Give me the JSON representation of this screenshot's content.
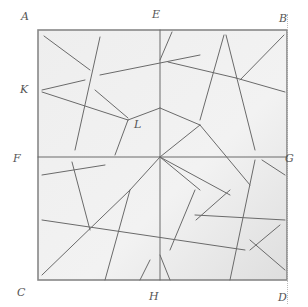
{
  "diagram": {
    "title": "",
    "colors": {
      "paper": "#eeeeee",
      "border": "#888888",
      "line": "#6a6a6a",
      "label": "#555555"
    },
    "labels": [
      {
        "id": "A",
        "text": "A",
        "x": 26,
        "y": 20
      },
      {
        "id": "E",
        "text": "E",
        "x": 157,
        "y": 18
      },
      {
        "id": "B",
        "text": "B",
        "x": 284,
        "y": 22
      },
      {
        "id": "K",
        "text": "K",
        "x": 25,
        "y": 93
      },
      {
        "id": "L",
        "text": "L",
        "x": 139,
        "y": 128
      },
      {
        "id": "F",
        "text": "F",
        "x": 18,
        "y": 162
      },
      {
        "id": "G",
        "text": "G",
        "x": 290,
        "y": 162
      },
      {
        "id": "C",
        "text": "C",
        "x": 22,
        "y": 296
      },
      {
        "id": "H",
        "text": "H",
        "x": 154,
        "y": 300
      },
      {
        "id": "D",
        "text": "D",
        "x": 283,
        "y": 301
      }
    ],
    "square": {
      "x1": 38,
      "y1": 30,
      "x2": 287,
      "y2": 280
    },
    "lines": [
      [
        160,
        30,
        160,
        280
      ],
      [
        38,
        157,
        287,
        157
      ],
      [
        44,
        36,
        90,
        70
      ],
      [
        100,
        37,
        75,
        150
      ],
      [
        42,
        90,
        85,
        80
      ],
      [
        100,
        75,
        200,
        55
      ],
      [
        42,
        92,
        128,
        120
      ],
      [
        95,
        90,
        128,
        118
      ],
      [
        128,
        120,
        160,
        108
      ],
      [
        160,
        108,
        200,
        125
      ],
      [
        172,
        32,
        160,
        60
      ],
      [
        168,
        62,
        236,
        78
      ],
      [
        236,
        78,
        285,
        92
      ],
      [
        224,
        35,
        200,
        120
      ],
      [
        226,
        35,
        255,
        150
      ],
      [
        284,
        35,
        240,
        80
      ],
      [
        128,
        120,
        115,
        155
      ],
      [
        200,
        125,
        250,
        185
      ],
      [
        42,
        175,
        105,
        165
      ],
      [
        72,
        162,
        90,
        230
      ],
      [
        42,
        220,
        245,
        250
      ],
      [
        42,
        275,
        130,
        190
      ],
      [
        130,
        190,
        160,
        157
      ],
      [
        130,
        190,
        105,
        280
      ],
      [
        160,
        157,
        200,
        125
      ],
      [
        160,
        157,
        230,
        195
      ],
      [
        195,
        190,
        170,
        250
      ],
      [
        195,
        215,
        285,
        220
      ],
      [
        255,
        160,
        230,
        280
      ],
      [
        262,
        160,
        285,
        175
      ],
      [
        250,
        240,
        285,
        270
      ],
      [
        250,
        250,
        280,
        225
      ],
      [
        196,
        220,
        230,
        190
      ],
      [
        140,
        280,
        150,
        260
      ],
      [
        170,
        280,
        160,
        255
      ],
      [
        160,
        157,
        200,
        190
      ]
    ]
  }
}
